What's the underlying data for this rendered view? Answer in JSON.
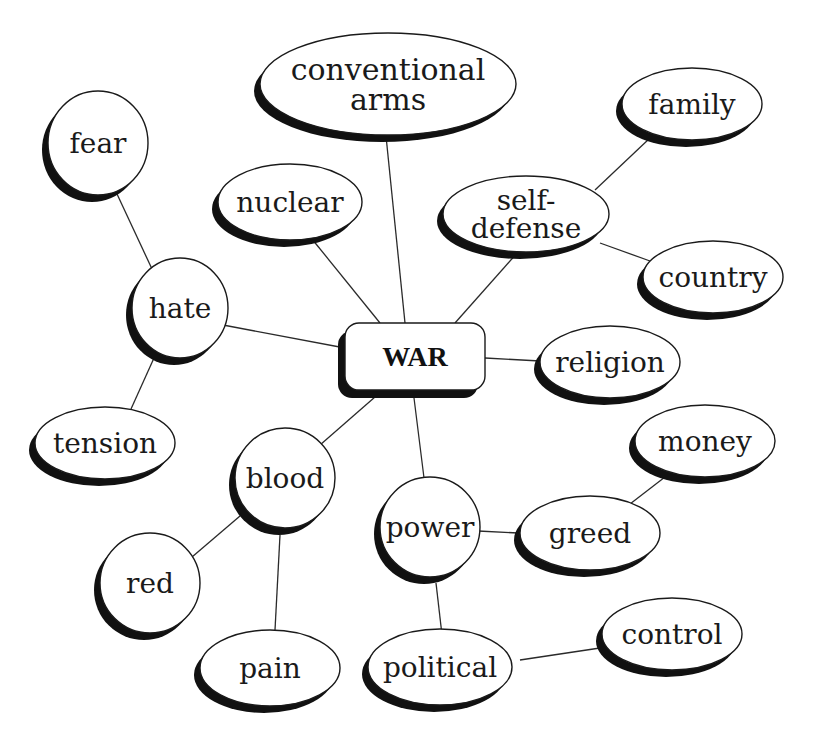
{
  "title": "WAR",
  "colors": {
    "background": "#ffffff",
    "outline": "#1a1a1a",
    "shadow": "#111111",
    "edge": "#2a2a2a",
    "text": "#1a1a1a"
  },
  "center": {
    "id": "war",
    "label": "WAR",
    "x": 345,
    "y": 323,
    "w": 140,
    "h": 67,
    "r": 14,
    "font_size": 28
  },
  "nodes": [
    {
      "id": "conventional-arms",
      "lines": [
        "conventional",
        "arms"
      ],
      "cx": 388,
      "cy": 84,
      "rx": 128,
      "ry": 51,
      "font_size": 30
    },
    {
      "id": "family",
      "lines": [
        "family"
      ],
      "cx": 692,
      "cy": 104,
      "rx": 70,
      "ry": 36,
      "font_size": 28
    },
    {
      "id": "fear",
      "lines": [
        "fear"
      ],
      "cx": 98,
      "cy": 143,
      "rx": 50,
      "ry": 52,
      "font_size": 28
    },
    {
      "id": "nuclear",
      "lines": [
        "nuclear"
      ],
      "cx": 290,
      "cy": 202,
      "rx": 72,
      "ry": 38,
      "font_size": 28
    },
    {
      "id": "self-defense",
      "lines": [
        "self-",
        "defense"
      ],
      "cx": 526,
      "cy": 214,
      "rx": 83,
      "ry": 38,
      "font_size": 28
    },
    {
      "id": "country",
      "lines": [
        "country"
      ],
      "cx": 713,
      "cy": 277,
      "rx": 70,
      "ry": 36,
      "font_size": 28
    },
    {
      "id": "hate",
      "lines": [
        "hate"
      ],
      "cx": 180,
      "cy": 308,
      "rx": 48,
      "ry": 50,
      "font_size": 28
    },
    {
      "id": "religion",
      "lines": [
        "religion"
      ],
      "cx": 610,
      "cy": 362,
      "rx": 70,
      "ry": 36,
      "font_size": 28
    },
    {
      "id": "tension",
      "lines": [
        "tension"
      ],
      "cx": 105,
      "cy": 443,
      "rx": 70,
      "ry": 36,
      "font_size": 28
    },
    {
      "id": "money",
      "lines": [
        "money"
      ],
      "cx": 705,
      "cy": 441,
      "rx": 70,
      "ry": 36,
      "font_size": 28
    },
    {
      "id": "blood",
      "lines": [
        "blood"
      ],
      "cx": 285,
      "cy": 478,
      "rx": 50,
      "ry": 50,
      "font_size": 28
    },
    {
      "id": "power",
      "lines": [
        "power"
      ],
      "cx": 430,
      "cy": 527,
      "rx": 50,
      "ry": 50,
      "font_size": 28
    },
    {
      "id": "greed",
      "lines": [
        "greed"
      ],
      "cx": 590,
      "cy": 533,
      "rx": 70,
      "ry": 37,
      "font_size": 28
    },
    {
      "id": "red",
      "lines": [
        "red"
      ],
      "cx": 150,
      "cy": 583,
      "rx": 50,
      "ry": 50,
      "font_size": 28
    },
    {
      "id": "control",
      "lines": [
        "control"
      ],
      "cx": 672,
      "cy": 634,
      "rx": 70,
      "ry": 36,
      "font_size": 28
    },
    {
      "id": "pain",
      "lines": [
        "pain"
      ],
      "cx": 270,
      "cy": 668,
      "rx": 70,
      "ry": 38,
      "font_size": 28
    },
    {
      "id": "political",
      "lines": [
        "political"
      ],
      "cx": 440,
      "cy": 667,
      "rx": 72,
      "ry": 38,
      "font_size": 28
    }
  ],
  "edges": [
    {
      "from": "war",
      "to": "conventional-arms",
      "x1": 405,
      "y1": 323,
      "x2": 386,
      "y2": 136
    },
    {
      "from": "war",
      "to": "nuclear",
      "x1": 380,
      "y1": 323,
      "x2": 312,
      "y2": 239
    },
    {
      "from": "war",
      "to": "self-defense",
      "x1": 455,
      "y1": 323,
      "x2": 518,
      "y2": 252
    },
    {
      "from": "war",
      "to": "hate",
      "x1": 345,
      "y1": 348,
      "x2": 223,
      "y2": 325
    },
    {
      "from": "war",
      "to": "religion",
      "x1": 485,
      "y1": 358,
      "x2": 540,
      "y2": 361
    },
    {
      "from": "war",
      "to": "blood",
      "x1": 383,
      "y1": 390,
      "x2": 320,
      "y2": 445
    },
    {
      "from": "war",
      "to": "power",
      "x1": 413,
      "y1": 390,
      "x2": 424,
      "y2": 478
    },
    {
      "from": "self-defense",
      "to": "family",
      "x1": 595,
      "y1": 190,
      "x2": 650,
      "y2": 138
    },
    {
      "from": "self-defense",
      "to": "country",
      "x1": 600,
      "y1": 243,
      "x2": 650,
      "y2": 261
    },
    {
      "from": "hate",
      "to": "fear",
      "x1": 152,
      "y1": 269,
      "x2": 117,
      "y2": 194
    },
    {
      "from": "hate",
      "to": "tension",
      "x1": 154,
      "y1": 358,
      "x2": 131,
      "y2": 409
    },
    {
      "from": "blood",
      "to": "red",
      "x1": 240,
      "y1": 516,
      "x2": 192,
      "y2": 557
    },
    {
      "from": "blood",
      "to": "pain",
      "x1": 280,
      "y1": 535,
      "x2": 275,
      "y2": 630
    },
    {
      "from": "power",
      "to": "greed",
      "x1": 478,
      "y1": 531,
      "x2": 518,
      "y2": 533
    },
    {
      "from": "power",
      "to": "political",
      "x1": 436,
      "y1": 583,
      "x2": 442,
      "y2": 635
    },
    {
      "from": "greed",
      "to": "money",
      "x1": 630,
      "y1": 504,
      "x2": 665,
      "y2": 477
    },
    {
      "from": "political",
      "to": "control",
      "x1": 520,
      "y1": 660,
      "x2": 600,
      "y2": 648
    }
  ]
}
